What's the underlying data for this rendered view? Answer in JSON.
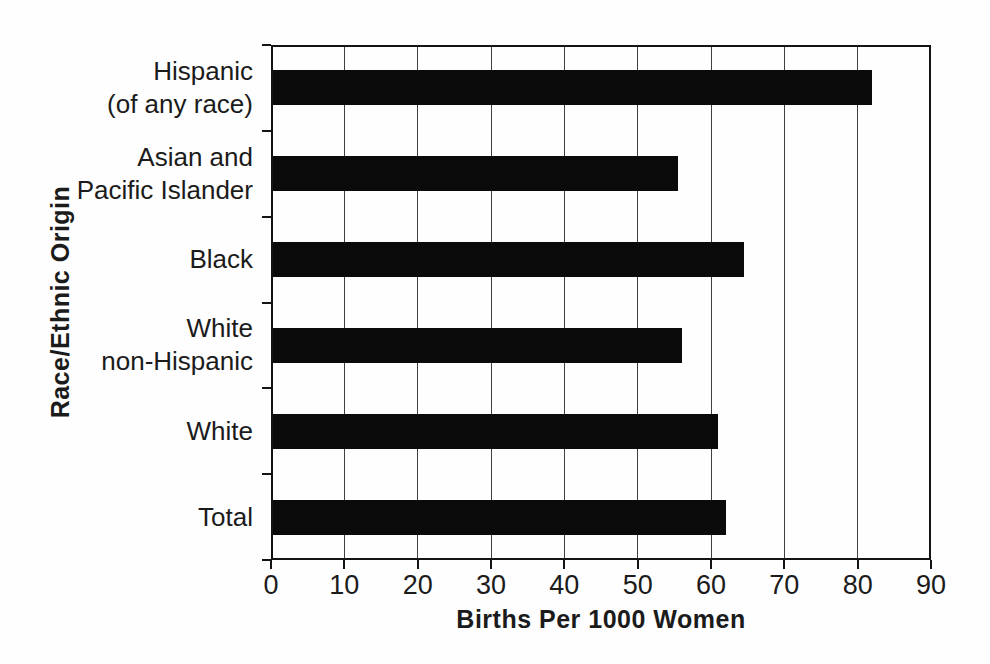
{
  "chart_data": {
    "type": "bar",
    "orientation": "horizontal",
    "title": "",
    "xlabel": "Births Per 1000 Women",
    "ylabel": "Race/Ethnic Origin",
    "categories": [
      "Hispanic\n(of any race)",
      "Asian and\nPacific Islander",
      "Black",
      "White\nnon-Hispanic",
      "White",
      "Total"
    ],
    "values": [
      82,
      55.5,
      64.5,
      56,
      61,
      62
    ],
    "category_order": "top-to-bottom",
    "xlim": [
      0,
      90
    ],
    "xticks": [
      0,
      10,
      20,
      30,
      40,
      50,
      60,
      70,
      80,
      90
    ],
    "grid": "vertical",
    "legend": "none"
  },
  "colors": {
    "bar": "#0a0a0a",
    "axis": "#141414",
    "gridline": "#3f3f3f",
    "text": "#1b1b1b",
    "background": "#fefefe"
  }
}
